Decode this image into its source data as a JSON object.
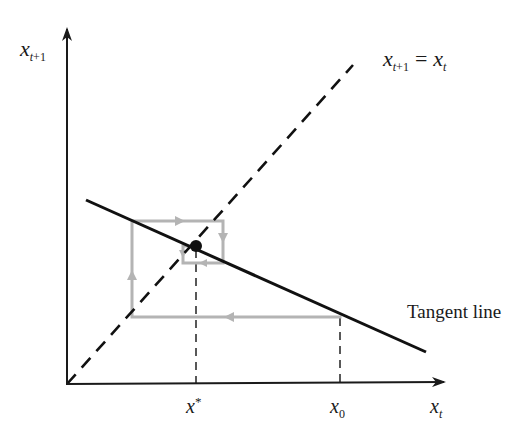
{
  "diagram": {
    "type": "cobweb-diagram",
    "y_axis_label": {
      "base": "x",
      "subscript_var": "t",
      "subscript_rest": "+1"
    },
    "x_axis_label": {
      "base": "x",
      "subscript_var": "t"
    },
    "identity_line_label": {
      "lhs_base": "x",
      "lhs_sub_var": "t",
      "lhs_sub_rest": "+1",
      "equals": "=",
      "rhs_base": "x",
      "rhs_sub_var": "t"
    },
    "tangent_label": "Tangent line",
    "tick_labels": {
      "fixed_point": {
        "base": "x",
        "sup": "*"
      },
      "initial": {
        "base": "x",
        "sub": "0"
      }
    },
    "colors": {
      "axes": "#1a1a1a",
      "tangent": "#111111",
      "identity_dashed": "#111111",
      "cobweb": "#b4b4b4",
      "fixed_point_dot": "#111111"
    }
  }
}
